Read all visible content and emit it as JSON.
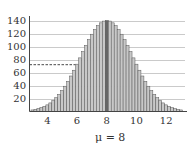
{
  "chart_data": {
    "type": "bar",
    "title": "",
    "xlabel": "μ = 8",
    "ylabel": "",
    "xlim": [
      2.8,
      13.4
    ],
    "ylim": [
      0,
      150
    ],
    "x_ticks": [
      4,
      6,
      8,
      10,
      12
    ],
    "y_ticks": [
      20,
      40,
      60,
      80,
      100,
      120,
      140
    ],
    "grid": {
      "horizontal": true,
      "vertical": false
    },
    "bar_width": 0.2,
    "x": [
      3.0,
      3.2,
      3.4,
      3.6,
      3.8,
      4.0,
      4.2,
      4.4,
      4.6,
      4.8,
      5.0,
      5.2,
      5.4,
      5.6,
      5.8,
      6.0,
      6.2,
      6.4,
      6.6,
      6.8,
      7.0,
      7.2,
      7.4,
      7.6,
      7.8,
      8.0,
      8.2,
      8.4,
      8.6,
      8.8,
      9.0,
      9.2,
      9.4,
      9.6,
      9.8,
      10.0,
      10.2,
      10.4,
      10.6,
      10.8,
      11.0,
      11.2,
      11.4,
      11.6,
      11.8,
      12.0,
      12.2,
      12.4,
      12.6,
      12.8,
      13.0
    ],
    "values": [
      2.4,
      3.2,
      4.4,
      5.9,
      7.8,
      10.2,
      13.2,
      16.8,
      21.2,
      26.3,
      32.2,
      38.9,
      46.4,
      54.6,
      63.5,
      72.8,
      82.5,
      92.1,
      101.6,
      110.6,
      118.9,
      126.1,
      132.0,
      136.4,
      139.1,
      140.0,
      139.1,
      136.4,
      132.0,
      126.1,
      118.9,
      110.6,
      101.6,
      92.1,
      82.5,
      72.8,
      63.5,
      54.6,
      46.4,
      38.9,
      32.2,
      26.3,
      21.2,
      16.8,
      13.2,
      10.2,
      7.8,
      5.9,
      4.4,
      3.2,
      2.4
    ],
    "highlight_bar": {
      "x": 8.0,
      "color": "#666666"
    },
    "bar_color": "#c8c8c8",
    "bar_edge_color": "#555555",
    "annotations": [
      {
        "type": "dashed-hline",
        "y": 72,
        "x_from": 2.8,
        "x_to": 6.0,
        "label": ""
      }
    ],
    "mean_label": "μ = 8"
  }
}
